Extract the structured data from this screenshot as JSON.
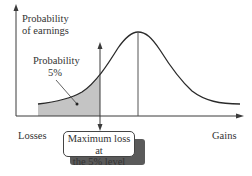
{
  "diagram": {
    "y_axis_label_line1": "Probability",
    "y_axis_label_line2": "of earnings",
    "tail_label_line1": "Probability",
    "tail_label_line2": "5%",
    "x_left_label": "Losses",
    "x_right_label": "Gains",
    "callout_line1": "Maximum loss at",
    "callout_line2": "the 5% level",
    "colors": {
      "axis": "#3a3a3a",
      "curve": "#2a2a2a",
      "shaded_tail": "#c4c4c4",
      "callout_shadow": "#5a5a5a"
    }
  }
}
